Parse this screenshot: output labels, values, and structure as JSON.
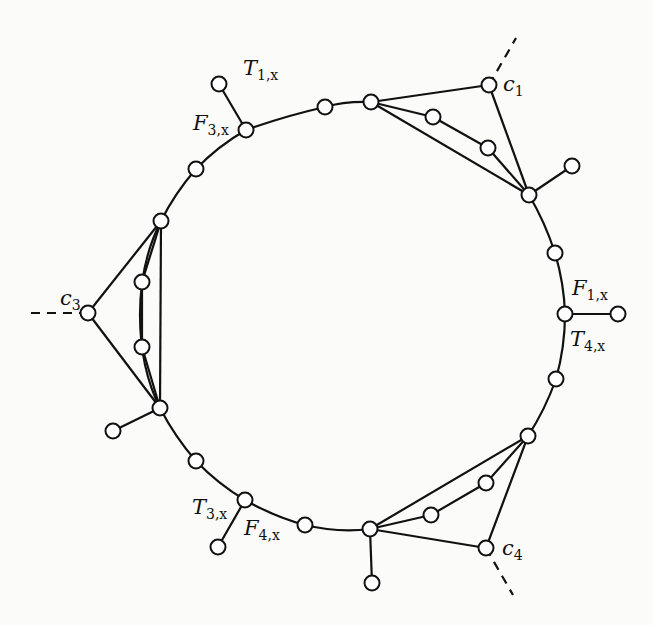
{
  "figure": {
    "type": "graph-gadget-diagram",
    "labels": [
      {
        "id": "T1x",
        "main": "T",
        "sub": "1,x",
        "x": 243,
        "y": 56
      },
      {
        "id": "F3x",
        "main": "F",
        "sub": "3,x",
        "x": 193,
        "y": 111
      },
      {
        "id": "c1",
        "main": "c",
        "sub": "1",
        "x": 503,
        "y": 72
      },
      {
        "id": "F1x",
        "main": "F",
        "sub": "1,x",
        "x": 572,
        "y": 276
      },
      {
        "id": "T4x",
        "main": "T",
        "sub": "4,x",
        "x": 570,
        "y": 327
      },
      {
        "id": "c3",
        "main": "c",
        "sub": "3",
        "x": 60,
        "y": 286
      },
      {
        "id": "T3x",
        "main": "T",
        "sub": "3,x",
        "x": 192,
        "y": 495
      },
      {
        "id": "F4x",
        "main": "F",
        "sub": "4,x",
        "x": 244,
        "y": 516
      },
      {
        "id": "c4",
        "main": "c",
        "sub": "4",
        "x": 502,
        "y": 536
      }
    ],
    "nodes": [
      {
        "id": "n_top1",
        "x": 325,
        "y": 107
      },
      {
        "id": "n_F3x",
        "x": 246,
        "y": 130
      },
      {
        "id": "n_p1",
        "x": 219,
        "y": 84
      },
      {
        "id": "n_l1",
        "x": 196,
        "y": 169
      },
      {
        "id": "n_j3a",
        "x": 161,
        "y": 221
      },
      {
        "id": "n_i3a",
        "x": 142,
        "y": 282
      },
      {
        "id": "n_c3",
        "x": 88,
        "y": 313
      },
      {
        "id": "n_i3b",
        "x": 142,
        "y": 347
      },
      {
        "id": "n_j3b",
        "x": 160,
        "y": 408
      },
      {
        "id": "n_p3",
        "x": 113,
        "y": 431
      },
      {
        "id": "n_l2",
        "x": 196,
        "y": 461
      },
      {
        "id": "n_T3x",
        "x": 245,
        "y": 500
      },
      {
        "id": "n_p4",
        "x": 218,
        "y": 547
      },
      {
        "id": "n_b1",
        "x": 305,
        "y": 525
      },
      {
        "id": "n_j4a",
        "x": 370,
        "y": 529
      },
      {
        "id": "n_p5",
        "x": 372,
        "y": 583
      },
      {
        "id": "n_i4a",
        "x": 431,
        "y": 515
      },
      {
        "id": "n_i4b",
        "x": 486,
        "y": 483
      },
      {
        "id": "n_c4",
        "x": 486,
        "y": 548
      },
      {
        "id": "n_j4b",
        "x": 528,
        "y": 436
      },
      {
        "id": "n_r2",
        "x": 556,
        "y": 379
      },
      {
        "id": "n_T4x",
        "x": 565,
        "y": 314
      },
      {
        "id": "n_p6",
        "x": 618,
        "y": 314
      },
      {
        "id": "n_r1",
        "x": 555,
        "y": 253
      },
      {
        "id": "n_j1b",
        "x": 529,
        "y": 195
      },
      {
        "id": "n_p2",
        "x": 572,
        "y": 166
      },
      {
        "id": "n_i1b",
        "x": 488,
        "y": 148
      },
      {
        "id": "n_i1a",
        "x": 433,
        "y": 117
      },
      {
        "id": "n_j1a",
        "x": 371,
        "y": 102
      },
      {
        "id": "n_c1",
        "x": 489,
        "y": 85
      }
    ],
    "cycle_path": "M 371 102 Q 345 101 325 107 Q 285 116 246 130 Q 218 146 196 169 Q 175 193 161 221 Q 140 262 140 315 Q 140 368 160 408 Q 175 437 196 461 Q 218 484 245 500 Q 275 517 305 525 Q 338 533 370 529 M 528 436 Q 545 410 556 379 Q 565 347 565 314 Q 564 283 555 253 Q 545 222 529 195",
    "edges": [
      [
        219,
        84,
        246,
        130
      ],
      [
        618,
        314,
        565,
        314
      ],
      [
        529,
        195,
        572,
        166
      ],
      [
        160,
        408,
        113,
        431
      ],
      [
        245,
        500,
        218,
        547
      ],
      [
        370,
        529,
        372,
        583
      ],
      [
        371,
        102,
        489,
        85
      ],
      [
        489,
        85,
        529,
        195
      ],
      [
        371,
        102,
        529,
        195
      ],
      [
        371,
        102,
        433,
        117
      ],
      [
        433,
        117,
        488,
        148
      ],
      [
        488,
        148,
        529,
        195
      ],
      [
        161,
        221,
        88,
        313
      ],
      [
        88,
        313,
        160,
        408
      ],
      [
        161,
        221,
        160,
        408
      ],
      [
        161,
        221,
        142,
        282
      ],
      [
        142,
        282,
        142,
        347
      ],
      [
        142,
        347,
        160,
        408
      ],
      [
        370,
        529,
        486,
        548
      ],
      [
        486,
        548,
        528,
        436
      ],
      [
        370,
        529,
        528,
        436
      ],
      [
        370,
        529,
        431,
        515
      ],
      [
        431,
        515,
        486,
        483
      ],
      [
        486,
        483,
        528,
        436
      ]
    ],
    "dashed_edges": [
      [
        489,
        85,
        516,
        38
      ],
      [
        88,
        313,
        30,
        313
      ],
      [
        486,
        548,
        513,
        595
      ]
    ]
  }
}
